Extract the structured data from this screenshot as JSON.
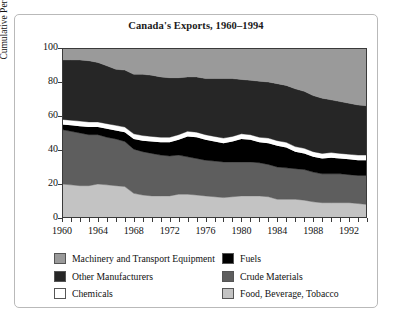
{
  "chart_data": {
    "type": "area",
    "title": "Canada's Exports, 1960–1994",
    "xlabel": "",
    "ylabel": "Cumulative Percent",
    "ylim": [
      0,
      100
    ],
    "xlim": [
      1960,
      1994
    ],
    "grid": false,
    "stacked": true,
    "legend_position": "bottom",
    "x": [
      1960,
      1961,
      1962,
      1963,
      1964,
      1965,
      1966,
      1967,
      1968,
      1969,
      1970,
      1971,
      1972,
      1973,
      1974,
      1975,
      1976,
      1977,
      1978,
      1979,
      1980,
      1981,
      1982,
      1983,
      1984,
      1985,
      1986,
      1987,
      1988,
      1989,
      1990,
      1991,
      1992,
      1993,
      1994
    ],
    "xticks": [
      1960,
      1964,
      1968,
      1972,
      1976,
      1980,
      1984,
      1988,
      1992
    ],
    "yticks": [
      0,
      20,
      40,
      60,
      80,
      100
    ],
    "series": [
      {
        "name": "Food, Beverage, Tobacco",
        "color": "#c3c3c3",
        "values": [
          20,
          19.5,
          19,
          19,
          20,
          19.5,
          19,
          18.5,
          14.5,
          13.5,
          13,
          13,
          13,
          14,
          14,
          13.5,
          13,
          12.5,
          12,
          12.5,
          13,
          13,
          13,
          12.5,
          11,
          11,
          11,
          10.5,
          9.5,
          9,
          9,
          9,
          9,
          8.5,
          8
        ]
      },
      {
        "name": "Crude Materials",
        "color": "#5e5e5e",
        "values": [
          32,
          31.5,
          31,
          30,
          29,
          28,
          27.5,
          26.5,
          26,
          25.5,
          25,
          24,
          23.5,
          23,
          22,
          21.5,
          21,
          21,
          21,
          20.5,
          20,
          20,
          19.5,
          19,
          19,
          18.5,
          18,
          18,
          17.5,
          17,
          17,
          17,
          16.5,
          16.5,
          17
        ]
      },
      {
        "name": "Fuels",
        "color": "#000000",
        "values": [
          3,
          3.5,
          4,
          4.5,
          4.5,
          5,
          5,
          5.5,
          6,
          6.5,
          7,
          7.5,
          8,
          9,
          12,
          12.5,
          12,
          11.5,
          11,
          12,
          13.5,
          13,
          12,
          12.5,
          12.5,
          12,
          10,
          9.5,
          9,
          9,
          9.5,
          9,
          9,
          9,
          9
        ]
      },
      {
        "name": "Chemicals",
        "color": "#ffffff",
        "values": [
          3,
          3,
          3,
          3,
          3,
          3,
          3,
          3,
          3,
          3,
          3,
          3,
          3,
          3,
          3,
          3,
          3,
          3,
          3,
          3,
          3,
          3,
          3,
          3,
          3,
          3,
          3,
          3,
          3,
          3,
          3,
          3,
          3,
          3,
          3
        ]
      },
      {
        "name": "Other Manufacturers",
        "color": "#262626",
        "values": [
          35,
          35.5,
          36,
          36,
          35,
          34,
          33,
          33.5,
          35,
          36,
          36,
          35.5,
          35,
          33.5,
          32,
          32.5,
          33,
          34,
          35,
          34,
          32,
          32,
          33,
          33,
          33.5,
          33.5,
          34,
          33.5,
          33,
          32.5,
          31,
          30.5,
          30,
          29.5,
          29
        ]
      },
      {
        "name": "Machinery and Transport Equipment",
        "color": "#9a9a9a",
        "values": [
          7,
          7.5,
          7,
          7.5,
          8.5,
          10.5,
          12.5,
          13,
          15.5,
          15.5,
          16,
          17,
          17.5,
          17.5,
          17,
          17,
          18,
          18,
          18,
          18,
          18.5,
          19,
          19.5,
          20,
          21,
          22,
          24,
          25.5,
          28,
          29.5,
          30.5,
          31.5,
          32.5,
          33.5,
          34
        ]
      }
    ]
  },
  "legend": {
    "left": [
      {
        "label": "Machinery and Transport Equipment",
        "color": "#9a9a9a"
      },
      {
        "label": "Other Manufacturers",
        "color": "#262626"
      },
      {
        "label": "Chemicals",
        "color": "#ffffff"
      }
    ],
    "right": [
      {
        "label": "Fuels",
        "color": "#000000"
      },
      {
        "label": "Crude Materials",
        "color": "#5e5e5e"
      },
      {
        "label": "Food, Beverage, Tobacco",
        "color": "#c3c3c3"
      }
    ]
  }
}
